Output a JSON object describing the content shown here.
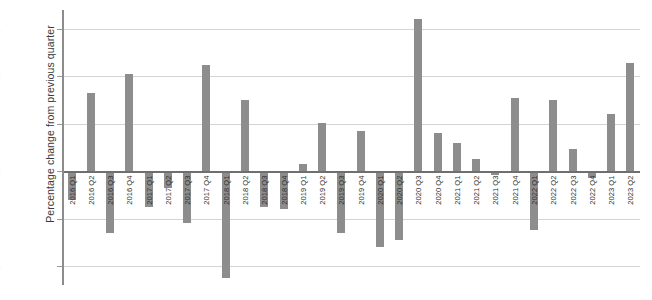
{
  "chart_data": {
    "type": "bar",
    "title": "",
    "xlabel": "",
    "ylabel": "Percentage change from previous quarter",
    "ylim": [
      -4.8,
      6.8
    ],
    "yticks": [
      6,
      4,
      2,
      0,
      -2,
      -4
    ],
    "ytick_labels": [
      "6",
      "4",
      "2",
      "0",
      "-2",
      "-4"
    ],
    "grid": true,
    "legend": "none",
    "bar_color": "#8d8d8d",
    "zero_line_color": "#6f6f6f",
    "categories": [
      "2016 Q1",
      "2016 Q2",
      "2016 Q3",
      "2016 Q4",
      "2017 Q1",
      "2017 Q2",
      "2017 Q3",
      "2017 Q4",
      "2018 Q1",
      "2018 Q2",
      "2018 Q3",
      "2018 Q4",
      "2019 Q1",
      "2019 Q2",
      "2019 Q3",
      "2019 Q4",
      "2020 Q1",
      "2020 Q2",
      "2020 Q3",
      "2020 Q4",
      "2021 Q1",
      "2021 Q2",
      "2021 Q3",
      "2021 Q4",
      "2022 Q1",
      "2022 Q2",
      "2022 Q3",
      "2022 Q4",
      "2023 Q1",
      "2023 Q2"
    ],
    "values": [
      -1.2,
      3.3,
      -2.6,
      4.1,
      -1.5,
      -0.7,
      -2.2,
      4.5,
      -4.5,
      3.0,
      -1.5,
      -1.6,
      0.3,
      2.05,
      -2.6,
      1.7,
      -3.2,
      -2.9,
      6.4,
      1.6,
      1.2,
      0.5,
      -0.15,
      3.1,
      -2.5,
      3.0,
      0.95,
      -0.3,
      2.4,
      4.55
    ]
  }
}
